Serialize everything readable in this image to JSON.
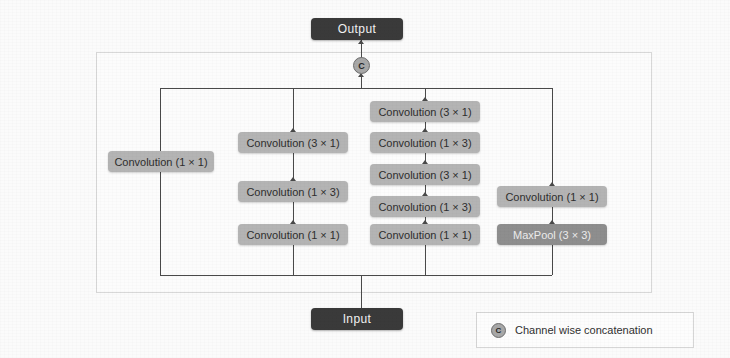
{
  "diagram": {
    "terminals": {
      "output": {
        "label": "Output"
      },
      "input": {
        "label": "Input"
      }
    },
    "concat_node": {
      "symbol": "C",
      "meaning": "Channel wise concatenation"
    },
    "branches": [
      {
        "id": "branch-1",
        "ops": [
          {
            "label": "Convolution (1 × 1)",
            "style": "light"
          }
        ]
      },
      {
        "id": "branch-2",
        "ops": [
          {
            "label": "Convolution (3 × 1)",
            "style": "light"
          },
          {
            "label": "Convolution (1 × 3)",
            "style": "light"
          },
          {
            "label": "Convolution (1 × 1)",
            "style": "light"
          }
        ]
      },
      {
        "id": "branch-3",
        "ops": [
          {
            "label": "Convolution (3 × 1)",
            "style": "light"
          },
          {
            "label": "Convolution (1 × 3)",
            "style": "light"
          },
          {
            "label": "Convolution (3 × 1)",
            "style": "light"
          },
          {
            "label": "Convolution (1 × 3)",
            "style": "light"
          },
          {
            "label": "Convolution (1 × 1)",
            "style": "light"
          }
        ]
      },
      {
        "id": "branch-4",
        "ops": [
          {
            "label": "Convolution (1 × 1)",
            "style": "light"
          },
          {
            "label": "MaxPool (3 × 3)",
            "style": "dark"
          }
        ]
      }
    ],
    "legend": {
      "badge": "C",
      "text": "Channel wise concatenation"
    },
    "colors": {
      "terminal_fill": "#3a3a3a",
      "op_fill": "#b4b4b4",
      "op_fill_dark": "#8e8e8e",
      "wire": "#4a4a4a",
      "panel_border": "#d8d8d8",
      "background": "#fbfbfb"
    }
  }
}
